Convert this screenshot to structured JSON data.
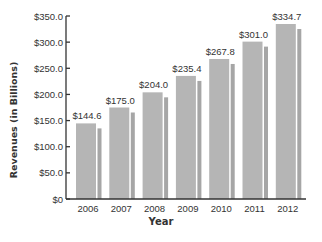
{
  "chart_data": {
    "type": "bar",
    "title": "",
    "xlabel": "Year",
    "ylabel": "Revenues (in Billions)",
    "categories": [
      "2006",
      "2007",
      "2008",
      "2009",
      "2010",
      "2011",
      "2012"
    ],
    "values": [
      144.6,
      175.0,
      204.0,
      235.4,
      267.8,
      301.0,
      334.7
    ],
    "data_labels": [
      "$144.6",
      "$175.0",
      "$204.0",
      "$235.4",
      "$267.8",
      "$301.0",
      "$334.7"
    ],
    "yticks": [
      0,
      50,
      100,
      150,
      200,
      250,
      300,
      350
    ],
    "ytick_labels": [
      "$0",
      "$50.0",
      "$100.0",
      "$150.0",
      "$200.0",
      "$250.0",
      "$300.0",
      "$350.0"
    ],
    "ylim": [
      0,
      350
    ],
    "grid": false,
    "legend": null,
    "colors": {
      "bar": "#b5b5b5",
      "bar_shadow": "#a6a6a6",
      "axis": "#333333",
      "text": "#333333"
    }
  }
}
